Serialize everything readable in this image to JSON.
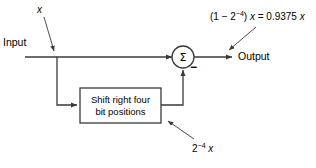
{
  "diagram": {
    "type": "signal-flow-block-diagram",
    "stroke_color": "#3a3a3a",
    "text_color": "#000000",
    "background": "#ffffff",
    "labels": {
      "input": "Input",
      "output": "Output",
      "signal_x": "x",
      "transfer": {
        "prefix": "(1 − 2",
        "exponent": "−4",
        "middle": ") ",
        "variable": "x",
        "equals": " = 0.9375 ",
        "result_variable": "x",
        "full": "(1 − 2⁻⁴) x = 0.9375 x"
      },
      "feedback": {
        "base": "2",
        "exponent": "−4",
        "variable": "x",
        "full": "2⁻⁴ x"
      }
    },
    "nodes": {
      "branch_point": {
        "label": "branch-junction",
        "x": 57,
        "y": 57
      },
      "adder": {
        "label": "summing-junction",
        "glyph": "Σ",
        "sign": "−",
        "x": 183,
        "y": 57,
        "radius": 11
      },
      "shift_block": {
        "line1": "Shift right four",
        "line2": "bit positions",
        "x": 80,
        "y": 88,
        "width": 81,
        "height": 35
      }
    }
  }
}
